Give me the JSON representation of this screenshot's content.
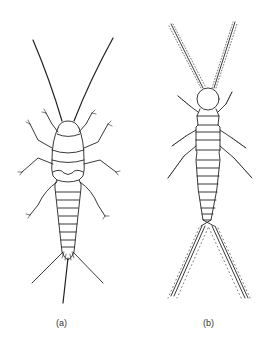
{
  "figure": {
    "panels": [
      {
        "id": "a",
        "label": "(a)",
        "subject": "insect-bristletail-wide-body"
      },
      {
        "id": "b",
        "label": "(b)",
        "subject": "insect-slender-body-with-setose-cerci"
      }
    ],
    "colors": {
      "ink": "#222222",
      "background": "#ffffff"
    }
  }
}
